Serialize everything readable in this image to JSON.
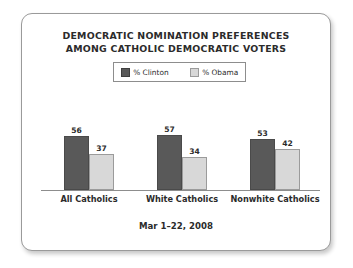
{
  "chart_data": {
    "type": "bar",
    "title": "DEMOCRATIC NOMINATION PREFERENCES AMONG CATHOLIC DEMOCRATIC VOTERS",
    "title_lines": [
      "DEMOCRATIC NOMINATION PREFERENCES",
      "AMONG CATHOLIC DEMOCRATIC VOTERS"
    ],
    "categories": [
      "All Catholics",
      "White Catholics",
      "Nonwhite Catholics"
    ],
    "series": [
      {
        "name": "% Clinton",
        "values": [
          56,
          57,
          53
        ],
        "color": "#595959"
      },
      {
        "name": "% Obama",
        "values": [
          37,
          34,
          42
        ],
        "color": "#d8d8d8"
      }
    ],
    "xlabel": "",
    "ylabel": "",
    "ylim": [
      0,
      100
    ],
    "grid": false,
    "legend_position": "top-center",
    "annotation": "Mar 1–22, 2008",
    "axis_color": "#8d8d8d"
  },
  "legend": {
    "items": [
      {
        "label": "% Clinton",
        "swatch": "dark-swatch-icon"
      },
      {
        "label": "% Obama",
        "swatch": "light-swatch-icon"
      }
    ]
  },
  "footer": {
    "date_range": "Mar 1–22, 2008"
  }
}
